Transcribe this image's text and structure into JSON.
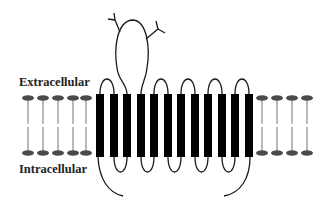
{
  "diagram": {
    "labels": {
      "extracellular": "Extracellular",
      "intracellular": "Intracellular"
    },
    "colors": {
      "helix": "#000000",
      "chain": "#1a1a1a",
      "lipid_head": "#4a4a4a",
      "lipid_tail": "#8a8a8a",
      "label": "#222222"
    },
    "membrane": {
      "top_y": 94,
      "bottom_y": 157,
      "lipids_left_x": [
        28,
        43,
        58,
        73,
        86
      ],
      "lipids_right_x": [
        262,
        277,
        292,
        307
      ]
    },
    "helices": {
      "count": 12,
      "width": 8,
      "centers_x": [
        100,
        114,
        127,
        141,
        154,
        168,
        181,
        195,
        208,
        222,
        235,
        249
      ]
    },
    "extracellular_loops": [
      [
        1,
        2
      ],
      [
        3,
        4,
        "large-glycosylated"
      ],
      [
        5,
        6
      ],
      [
        7,
        8
      ],
      [
        9,
        10
      ],
      [
        11,
        12
      ]
    ],
    "intracellular_loops": [
      [
        2,
        3
      ],
      [
        4,
        5
      ],
      [
        6,
        7
      ],
      [
        8,
        9
      ],
      [
        10,
        11
      ]
    ],
    "termini": {
      "n_terminus": "intracellular, from helix 1",
      "c_terminus": "intracellular, from helix 12"
    },
    "glycosylation_sites": 2
  }
}
